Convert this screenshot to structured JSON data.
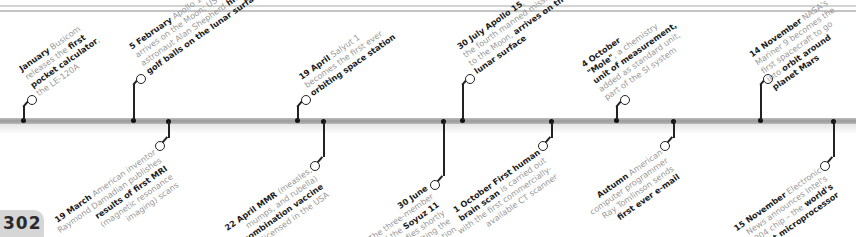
{
  "page": {
    "number": "302"
  },
  "colors": {
    "bar": "#a8a8a8",
    "stem": "#222222",
    "text_light": "#9a9a9a",
    "text_bold": "#1c1c1c",
    "page_tab": "#d6d6d6"
  },
  "top_events": [
    {
      "x": 23,
      "date": "January",
      "parts": [
        " Busicom",
        "releases the ",
        "first",
        "pocket calculator",
        ",",
        "the LE-120A"
      ]
    },
    {
      "x": 133,
      "date": "5 February",
      "parts": [
        " Apollo 14",
        "arrives on the Moon; US",
        "astronaut Alan Shepherd ",
        "hits",
        "golf balls on the lunar surface"
      ]
    },
    {
      "x": 297,
      "date": "19 April",
      "parts": [
        " Salyut 1",
        "becomes the first ever",
        "orbiting space station"
      ]
    },
    {
      "x": 462,
      "date": "30 July Apollo 15",
      "parts": [
        ",",
        "the fourth manned mission",
        "to the Moon, ",
        "arrives on the",
        "lunar surface"
      ]
    },
    {
      "x": 616,
      "date": "4 October",
      "parts": [
        "\"Mole\"",
        ", a chemistry",
        "unit of measurement,",
        "added as standard unit,",
        "part of the SI system"
      ]
    },
    {
      "x": 760,
      "date": "14 November",
      "parts": [
        " NASA's",
        "Mariner 9 becomes the",
        "first spacecraft to go",
        "into ",
        "orbit around",
        "planet Mars"
      ]
    }
  ],
  "bottom_events": [
    {
      "x": 168,
      "date": "19 March",
      "parts": [
        " American inventor",
        "Raymond Damadian publishes",
        "results of first MRI",
        "(magnetic resonance",
        "imaging) scans"
      ]
    },
    {
      "x": 323,
      "date": "22 April MMR",
      "parts": [
        " (measles,",
        "mumps, and rubella)",
        "combination vaccine",
        "licensed in the USA"
      ]
    },
    {
      "x": 443,
      "date": "30 June",
      "parts": [
        "The three-member",
        "crew of the ",
        "Soyuz 11",
        "spacecraft",
        " dies shortly",
        "after exiting the",
        "Salyut 1 space station"
      ]
    },
    {
      "x": 551,
      "date": "1 October First human",
      "parts": [
        "brain scan",
        " is carried out",
        "with the first commercially-",
        "available CT scanner"
      ]
    },
    {
      "x": 673,
      "date": "Autumn",
      "parts": [
        " American",
        "computer programmer",
        "Ray Tomlinson sends",
        "first ever e-mail"
      ]
    },
    {
      "x": 833,
      "date": "15 November",
      "parts": [
        " Electronic",
        "News announces Intel's",
        "4004 chip – the ",
        "world's",
        "first microprocessor"
      ]
    }
  ]
}
